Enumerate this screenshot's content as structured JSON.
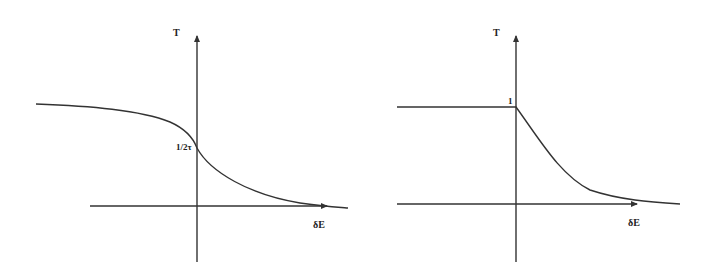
{
  "figure": {
    "panels": [
      {
        "id": "left",
        "y_axis_label": "T",
        "x_axis_label": "δE",
        "intercept_label": "1/2τ",
        "description": "Smooth step-down curve: high plateau for negative δE, passes 1/2τ at δE=0, decays toward zero for positive δE"
      },
      {
        "id": "right",
        "y_axis_label": "T",
        "x_axis_label": "δE",
        "intercept_label": "1",
        "description": "Flat at T=1 for δE<0, sharp kink at δE=0, then exponential-like decay toward zero for δE>0"
      }
    ]
  },
  "colors": {
    "line": "#333333",
    "background": "#ffffff"
  }
}
